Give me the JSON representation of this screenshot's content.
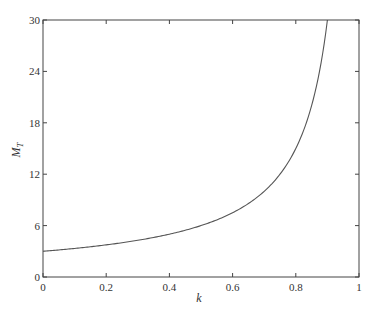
{
  "chart_data": {
    "type": "line",
    "title": "",
    "xlabel": "k",
    "ylabel": "M",
    "ylabel_subscript": "T",
    "xlim": [
      0,
      1
    ],
    "ylim": [
      0,
      30
    ],
    "xticks": [
      0,
      0.2,
      0.4,
      0.6,
      0.8,
      1
    ],
    "xtick_labels": [
      "0",
      "0.2",
      "0.4",
      "0.6",
      "0.8",
      "1"
    ],
    "yticks": [
      0,
      6,
      12,
      18,
      24,
      30
    ],
    "ytick_labels": [
      "0",
      "6",
      "12",
      "18",
      "24",
      "30"
    ],
    "grid": false,
    "legend": null,
    "series": [
      {
        "name": "M_T",
        "x": [
          0,
          0.1,
          0.2,
          0.3,
          0.4,
          0.5,
          0.6,
          0.7,
          0.75,
          0.8,
          0.85,
          0.9
        ],
        "values": [
          3.0,
          3.33,
          3.75,
          4.29,
          5.0,
          6.0,
          7.5,
          10.0,
          12.0,
          15.0,
          20.0,
          30.0
        ]
      }
    ],
    "line_color": "#555555"
  }
}
